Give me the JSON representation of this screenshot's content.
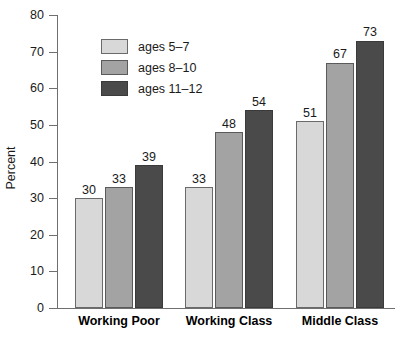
{
  "chart_data": {
    "type": "bar",
    "title": "",
    "subtitle": "",
    "xlabel": "",
    "ylabel": "Percent",
    "ylim": [
      0,
      80
    ],
    "ytick_step": 10,
    "yticks": [
      0,
      10,
      20,
      30,
      40,
      50,
      60,
      70,
      80
    ],
    "grid": false,
    "legend_position": "upper-left-inside",
    "categories": [
      "Working Poor",
      "Working Class",
      "Middle Class"
    ],
    "series": [
      {
        "name": "ages 5–7",
        "values": [
          30,
          33,
          51
        ],
        "color": "#d8d8d8"
      },
      {
        "name": "ages 8–10",
        "values": [
          33,
          48,
          67
        ],
        "color": "#a3a3a3"
      },
      {
        "name": "ages 11–12",
        "values": [
          39,
          54,
          73
        ],
        "color": "#4a4a4a"
      }
    ],
    "value_labels": [
      [
        "30",
        "33",
        "39"
      ],
      [
        "33",
        "48",
        "54"
      ],
      [
        "51",
        "67",
        "73"
      ]
    ]
  },
  "axis": {
    "y_title": "Percent",
    "y_tick_labels": [
      "80",
      "70",
      "60",
      "50",
      "40",
      "30",
      "20",
      "10",
      "0"
    ],
    "x_tick_labels": [
      "Working Poor",
      "Working Class",
      "Middle Class"
    ]
  },
  "legend": {
    "items": [
      {
        "label": "ages 5–7"
      },
      {
        "label": "ages 8–10"
      },
      {
        "label": "ages 11–12"
      }
    ]
  },
  "colors": {
    "series_light": "#d8d8d8",
    "series_medium": "#a3a3a3",
    "series_dark": "#4a4a4a",
    "axis": "#6f6f6f",
    "text": "#1a1a1a",
    "background": "#ffffff"
  }
}
